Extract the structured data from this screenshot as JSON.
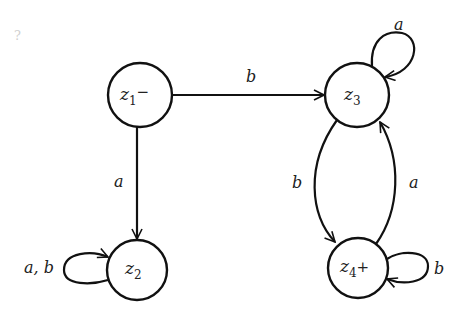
{
  "diagram": {
    "type": "finite-automaton",
    "nodes": [
      {
        "id": "z1",
        "name": "z",
        "index": "1",
        "marker": "−",
        "role": "start"
      },
      {
        "id": "z2",
        "name": "z",
        "index": "2",
        "marker": "",
        "role": "normal"
      },
      {
        "id": "z3",
        "name": "z",
        "index": "3",
        "marker": "",
        "role": "normal"
      },
      {
        "id": "z4",
        "name": "z",
        "index": "4",
        "marker": "+",
        "role": "accept"
      }
    ],
    "edges": [
      {
        "from": "z1",
        "to": "z3",
        "label": "b"
      },
      {
        "from": "z1",
        "to": "z2",
        "label": "a"
      },
      {
        "from": "z3",
        "to": "z3",
        "label": "a"
      },
      {
        "from": "z3",
        "to": "z4",
        "label": "b"
      },
      {
        "from": "z4",
        "to": "z3",
        "label": "a"
      },
      {
        "from": "z2",
        "to": "z2",
        "label": "a, b"
      },
      {
        "from": "z4",
        "to": "z4",
        "label": "b"
      }
    ],
    "stray_mark": "?"
  },
  "colors": {
    "stroke": "#111111",
    "text": "#222222",
    "background": "#ffffff"
  }
}
